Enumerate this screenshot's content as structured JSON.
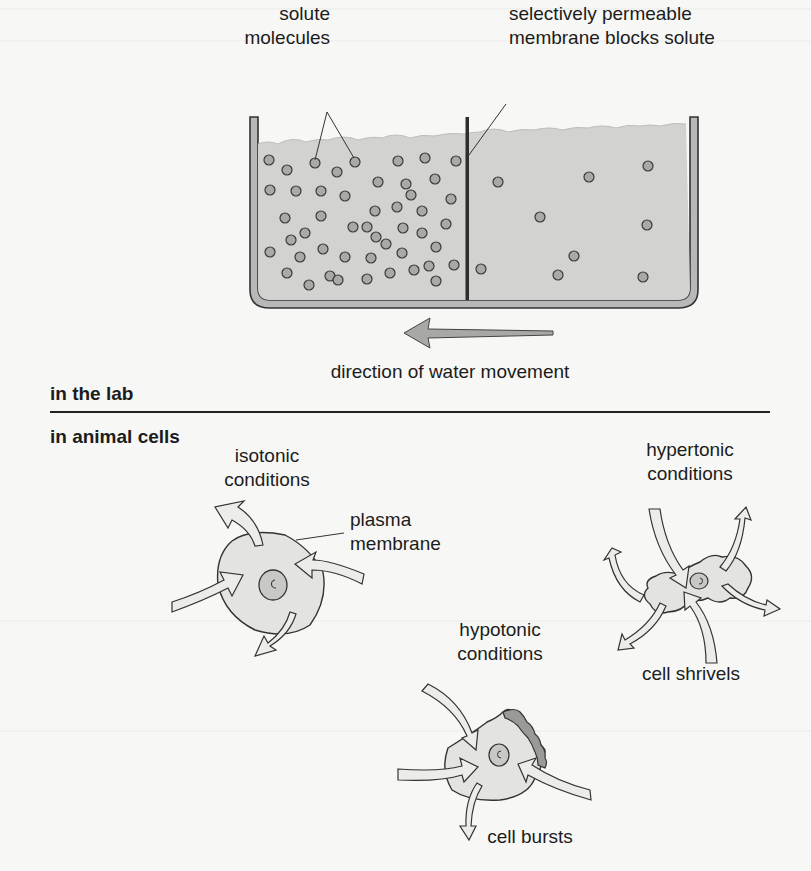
{
  "diagram": {
    "lab": {
      "section_label": "in the lab",
      "solute_label_line1": "solute",
      "solute_label_line2": "molecules",
      "membrane_label_line1": "selectively permeable",
      "membrane_label_line2": "membrane blocks solute",
      "arrow_caption": "direction of water movement",
      "left_compartment_solute_count": 48,
      "right_compartment_solute_count": 10
    },
    "cells": {
      "section_label": "in animal cells",
      "isotonic": {
        "line1": "isotonic",
        "line2": "conditions"
      },
      "plasma_membrane": {
        "line1": "plasma",
        "line2": "membrane"
      },
      "hypertonic": {
        "line1": "hypertonic",
        "line2": "conditions",
        "result": "cell shrivels"
      },
      "hypotonic": {
        "line1": "hypotonic",
        "line2": "conditions",
        "result": "cell bursts"
      }
    },
    "colors": {
      "water": "#d0d0d0",
      "tank": "#b8b8b8",
      "outline": "#333333",
      "cell_fill": "#e4e4e4",
      "arrow_fill": "#e9e9e9",
      "burst_fill": "#9a9a9a"
    }
  }
}
